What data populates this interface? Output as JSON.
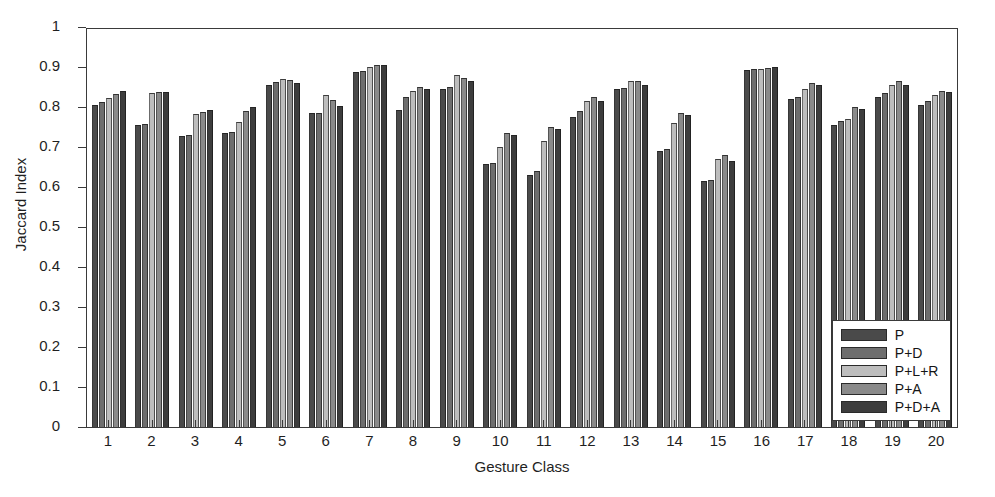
{
  "chart_data": {
    "type": "bar",
    "title": "",
    "xlabel": "Gesture Class",
    "ylabel": "Jaccard Index",
    "ylim": [
      0,
      1
    ],
    "ytick_labels": [
      "1",
      "0.9",
      "0.8",
      "0.7",
      "0.6",
      "0.5",
      "0.4",
      "0.3",
      "0.2",
      "0.1",
      "0"
    ],
    "yticks": [
      1,
      0.9,
      0.8,
      0.7,
      0.6,
      0.5,
      0.4,
      0.3,
      0.2,
      0.1,
      0
    ],
    "grid": false,
    "legend_position": "lower-right",
    "categories": [
      "1",
      "2",
      "3",
      "4",
      "5",
      "6",
      "7",
      "8",
      "9",
      "10",
      "11",
      "12",
      "13",
      "14",
      "15",
      "16",
      "17",
      "18",
      "19",
      "20"
    ],
    "series": [
      {
        "name": "P",
        "color": "#4a4a4a",
        "values": [
          0.805,
          0.755,
          0.727,
          0.735,
          0.855,
          0.785,
          0.888,
          0.792,
          0.845,
          0.657,
          0.63,
          0.775,
          0.845,
          0.69,
          0.615,
          0.893,
          0.82,
          0.755,
          0.825,
          0.805
        ]
      },
      {
        "name": "P+D",
        "color": "#6e6e6e",
        "values": [
          0.812,
          0.757,
          0.73,
          0.737,
          0.862,
          0.786,
          0.89,
          0.825,
          0.85,
          0.66,
          0.64,
          0.79,
          0.848,
          0.695,
          0.617,
          0.895,
          0.825,
          0.765,
          0.835,
          0.815
        ]
      },
      {
        "name": "P+L+R",
        "color": "#bdbdbd",
        "values": [
          0.822,
          0.835,
          0.782,
          0.762,
          0.87,
          0.83,
          0.9,
          0.84,
          0.88,
          0.7,
          0.715,
          0.815,
          0.865,
          0.76,
          0.67,
          0.895,
          0.845,
          0.77,
          0.855,
          0.83
        ]
      },
      {
        "name": "P+A",
        "color": "#8a8a8a",
        "values": [
          0.832,
          0.837,
          0.788,
          0.79,
          0.868,
          0.818,
          0.905,
          0.85,
          0.872,
          0.735,
          0.75,
          0.825,
          0.865,
          0.785,
          0.68,
          0.897,
          0.86,
          0.8,
          0.865,
          0.84
        ]
      },
      {
        "name": "P+D+A",
        "color": "#3d3d3d",
        "values": [
          0.84,
          0.838,
          0.792,
          0.8,
          0.86,
          0.802,
          0.905,
          0.845,
          0.865,
          0.73,
          0.745,
          0.815,
          0.855,
          0.78,
          0.665,
          0.9,
          0.855,
          0.795,
          0.855,
          0.838
        ]
      }
    ]
  }
}
